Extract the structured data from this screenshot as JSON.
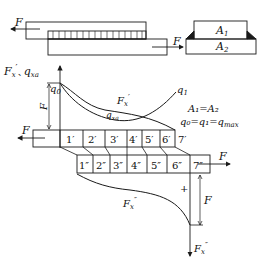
{
  "colors": {
    "line": "#1a1a1a",
    "background": "#ffffff"
  },
  "top_view": {
    "force_left": "F",
    "force_right": "F"
  },
  "cross_section": {
    "upper_area": "A",
    "upper_sub": "1",
    "lower_area": "A",
    "lower_sub": "2"
  },
  "axis": {
    "label_main": "F",
    "label_main_sub": "x",
    "label_main_prime": "′",
    "label_sep": "、",
    "label_q": "q",
    "label_q_sub": "xa"
  },
  "curves": {
    "q0_label": "q",
    "q0_sub": "0",
    "q1_label": "q",
    "q1_sub": "1",
    "fx_prime_label": "F",
    "fx_prime_sub": "x",
    "fx_prime_mark": "′",
    "qxa_label": "q",
    "qxa_sub": "xa",
    "f_vertical_label": "F"
  },
  "conditions": {
    "line1": "A₁=A₂",
    "line2_q": "q",
    "line2_rest": "₀=q₁=q",
    "line2_sub": "max"
  },
  "upper_bar": {
    "force_label": "F",
    "cells": [
      "1′",
      "2′",
      "3′",
      "4′",
      "5′",
      "6′"
    ],
    "end_label": "7′"
  },
  "lower_bar": {
    "force_label": "F",
    "cells": [
      "1″",
      "2″",
      "3″",
      "4″",
      "5″",
      "6″",
      "7″"
    ]
  },
  "lower_diagram": {
    "plus_sign": "+",
    "fx_double_label": "F",
    "fx_double_sub": "x",
    "fx_double_mark": "″",
    "f_label": "F",
    "axis_label": "F",
    "axis_sub": "x",
    "axis_mark": "″"
  }
}
